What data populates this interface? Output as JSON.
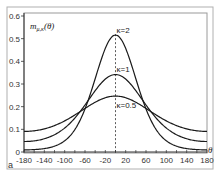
{
  "chart_data": {
    "type": "line",
    "title": "",
    "panel_label": "a",
    "xlabel": "θ",
    "ylabel": "m",
    "ylabel_subscript": "μ,κ",
    "ylabel_suffix": "(θ)",
    "xlim": [
      -180,
      180
    ],
    "ylim": [
      0,
      0.6
    ],
    "xticks": [
      -180,
      -140,
      -100,
      -60,
      -20,
      20,
      60,
      100,
      140,
      180
    ],
    "xtick_labels": [
      "-180",
      "-140",
      "-100",
      "-60",
      "-20",
      "20",
      "60",
      "100",
      "140",
      "180"
    ],
    "x_minor_tick_step": 20,
    "yticks": [
      0,
      0.1,
      0.2,
      0.3,
      0.4,
      0.5,
      0.6
    ],
    "ytick_labels": [
      "0",
      "0.1",
      "0.2",
      "0.3",
      "0.4",
      "0.5",
      "0.6"
    ],
    "grid": false,
    "mean_line": {
      "x": 0,
      "style": "dashed"
    },
    "x": [
      -180,
      -160,
      -140,
      -120,
      -100,
      -80,
      -60,
      -40,
      -20,
      0,
      20,
      40,
      60,
      80,
      100,
      120,
      140,
      160,
      180
    ],
    "series": [
      {
        "name": "κ=2",
        "label": "κ=2",
        "kappa": 2,
        "values": [
          0.009,
          0.01,
          0.015,
          0.025,
          0.043,
          0.078,
          0.138,
          0.24,
          0.378,
          0.516,
          0.378,
          0.24,
          0.138,
          0.078,
          0.043,
          0.025,
          0.015,
          0.01,
          0.009
        ]
      },
      {
        "name": "κ=1",
        "label": "κ=1",
        "kappa": 1,
        "values": [
          0.046,
          0.047,
          0.054,
          0.067,
          0.089,
          0.119,
          0.157,
          0.209,
          0.292,
          0.342,
          0.292,
          0.209,
          0.157,
          0.119,
          0.089,
          0.067,
          0.054,
          0.047,
          0.046
        ]
      },
      {
        "name": "κ=0.5",
        "label": "κ=0.5",
        "kappa": 0.5,
        "values": [
          0.091,
          0.093,
          0.099,
          0.11,
          0.125,
          0.143,
          0.169,
          0.209,
          0.239,
          0.247,
          0.239,
          0.209,
          0.169,
          0.143,
          0.125,
          0.11,
          0.099,
          0.093,
          0.091
        ]
      }
    ]
  }
}
